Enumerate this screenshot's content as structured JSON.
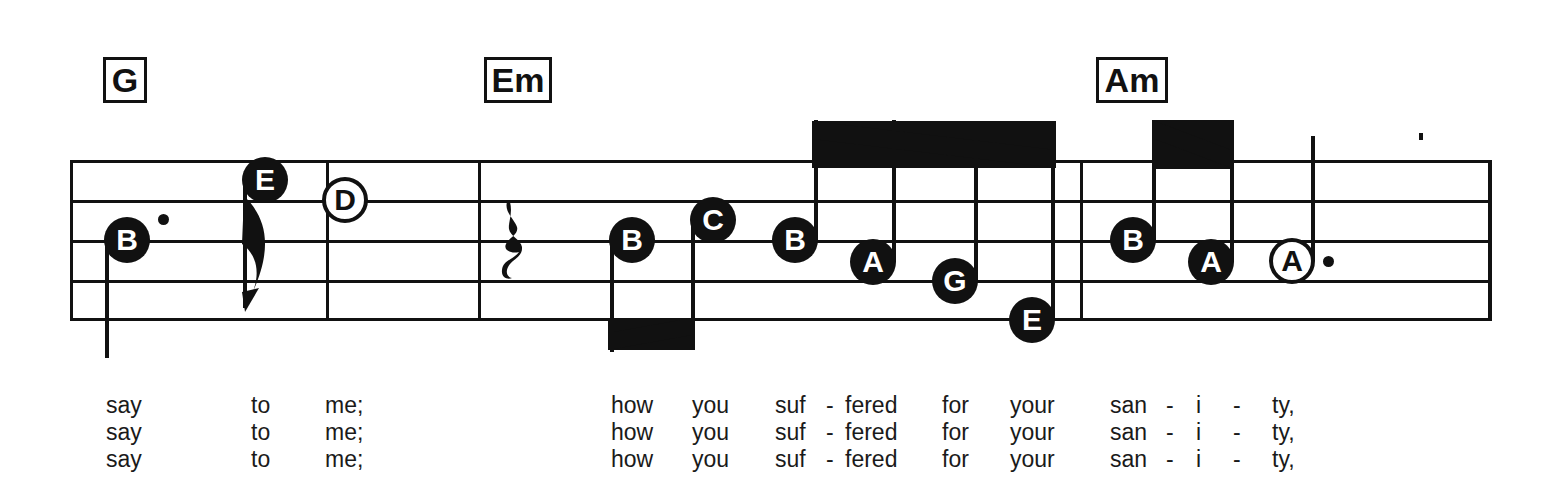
{
  "score": {
    "title": "",
    "ink_color": "#111111",
    "page_background": "#ffffff"
  },
  "chords": [
    {
      "name": "G",
      "x": 103,
      "y": 57,
      "w": 44,
      "h": 46,
      "font_size": 34
    },
    {
      "name": "Em",
      "x": 484,
      "y": 57,
      "w": 68,
      "h": 46,
      "font_size": 34
    },
    {
      "name": "Am",
      "x": 1096,
      "y": 57,
      "w": 72,
      "h": 46,
      "font_size": 34
    }
  ],
  "staff": {
    "left": 70,
    "right": 1490,
    "line_ys": [
      160,
      200,
      240,
      280,
      318
    ],
    "barline_xs": [
      326,
      478,
      1080
    ],
    "end_barline_x": 1488
  },
  "measures": [
    {
      "index": 1,
      "chord": "G",
      "notes": [
        {
          "label": "B",
          "head": "filled",
          "cx": 127,
          "cy": 240,
          "stem": "down",
          "stem_len": 118,
          "dotted": true,
          "value": "dotted-quarter"
        },
        {
          "label": "E",
          "head": "filled",
          "cx": 265,
          "cy": 180,
          "stem": "down",
          "stem_len": 128,
          "dotted": false,
          "value": "eighth",
          "flag": true
        },
        {
          "label": "D",
          "head": "hollow",
          "cx": 345,
          "cy": 200,
          "stem": "none",
          "dotted": false,
          "value": "half"
        }
      ]
    },
    {
      "index": 2,
      "chord": "Em",
      "rest": {
        "type": "quarter-rest",
        "cx": 512,
        "cy": 240
      },
      "notes": [
        {
          "label": "B",
          "head": "filled",
          "cx": 632,
          "cy": 240,
          "stem": "down",
          "stem_len": 112,
          "dotted": false,
          "value": "eighth",
          "beam_group": 1
        },
        {
          "label": "C",
          "head": "filled",
          "cx": 713,
          "cy": 220,
          "stem": "down",
          "stem_len": 130,
          "dotted": false,
          "value": "eighth",
          "beam_group": 1
        },
        {
          "label": "B",
          "head": "filled",
          "cx": 795,
          "cy": 240,
          "stem": "up",
          "stem_len": 120,
          "dotted": false,
          "value": "eighth",
          "beam_group": 2
        },
        {
          "label": "A",
          "head": "filled",
          "cx": 873,
          "cy": 262,
          "stem": "up",
          "stem_len": 142,
          "dotted": false,
          "value": "eighth",
          "beam_group": 2
        },
        {
          "label": "G",
          "head": "filled",
          "cx": 955,
          "cy": 281,
          "stem": "up",
          "stem_len": 152,
          "dotted": false,
          "value": "eighth",
          "beam_group": 2
        },
        {
          "label": "E",
          "head": "filled",
          "cx": 1032,
          "cy": 320,
          "stem": "up",
          "stem_len": 182,
          "dotted": false,
          "value": "eighth",
          "beam_group": 2
        }
      ],
      "beams": [
        {
          "group": 1,
          "x1": 608,
          "y1": 333,
          "x2": 692,
          "y2": 318,
          "thickness": 17,
          "direction": "below"
        },
        {
          "group": 2,
          "x1": 812,
          "y1": 121,
          "x2": 1056,
          "y2": 150,
          "thickness": 18,
          "direction": "above"
        }
      ]
    },
    {
      "index": 3,
      "chord": "Am",
      "notes": [
        {
          "label": "B",
          "head": "filled",
          "cx": 1133,
          "cy": 240,
          "stem": "up",
          "stem_len": 120,
          "dotted": false,
          "value": "eighth",
          "beam_group": 3
        },
        {
          "label": "A",
          "head": "filled",
          "cx": 1211,
          "cy": 262,
          "stem": "up",
          "stem_len": 142,
          "dotted": false,
          "value": "eighth",
          "beam_group": 3
        },
        {
          "label": "A",
          "head": "hollow",
          "cx": 1292,
          "cy": 261,
          "stem": "up",
          "stem_len": 125,
          "dotted": true,
          "value": "dotted-half"
        }
      ],
      "beams": [
        {
          "group": 3,
          "x1": 1152,
          "y1": 120,
          "x2": 1234,
          "y2": 151,
          "thickness": 18,
          "direction": "above"
        }
      ]
    }
  ],
  "stray_marks": [
    {
      "name": "ink-speck",
      "x": 1419,
      "y": 133,
      "w": 4,
      "h": 7
    }
  ],
  "lyrics": {
    "verse_count": 3,
    "line_height": 27,
    "syllables": [
      {
        "text": "say",
        "x": 106
      },
      {
        "text": "to",
        "x": 251
      },
      {
        "text": "me;",
        "x": 325
      },
      {
        "text": "how",
        "x": 611
      },
      {
        "text": "you",
        "x": 692
      },
      {
        "text": "suf",
        "x": 775
      },
      {
        "text": "-",
        "x": 826
      },
      {
        "text": "fered",
        "x": 845
      },
      {
        "text": "for",
        "x": 942
      },
      {
        "text": "your",
        "x": 1010
      },
      {
        "text": "san",
        "x": 1110
      },
      {
        "text": "-",
        "x": 1166
      },
      {
        "text": "i",
        "x": 1196
      },
      {
        "text": "-",
        "x": 1233
      },
      {
        "text": "ty,",
        "x": 1272
      }
    ],
    "verses": [
      {
        "index": 1,
        "top": 0
      },
      {
        "index": 2,
        "top": 27
      },
      {
        "index": 3,
        "top": 54
      }
    ]
  }
}
